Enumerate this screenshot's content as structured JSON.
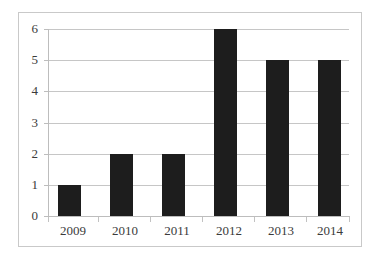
{
  "chart_data": {
    "type": "bar",
    "title": "",
    "subtitle": "",
    "xlabel": "",
    "ylabel": "",
    "categories": [
      "2009",
      "2010",
      "2011",
      "2012",
      "2013",
      "2014"
    ],
    "values": [
      1,
      2,
      2,
      6,
      5,
      5
    ],
    "series": [
      {
        "name": "",
        "values": [
          1,
          2,
          2,
          6,
          5,
          5
        ]
      }
    ],
    "ylim": [
      0,
      6
    ],
    "ytick_labels": [
      "0",
      "1",
      "2",
      "3",
      "4",
      "5",
      "6"
    ],
    "ytick_values": [
      0,
      1,
      2,
      3,
      4,
      5,
      6
    ],
    "grid": true,
    "grid_axis": "y",
    "legend": false,
    "legend_position": "none",
    "annotations": [],
    "colors": {
      "bar": "#1d1d1d",
      "gridline": "#c6c6c6",
      "axis": "#bdbdbd",
      "frame": "#c9c9c9",
      "background": "#ffffff",
      "tick_label": "#3b3b3b"
    }
  }
}
